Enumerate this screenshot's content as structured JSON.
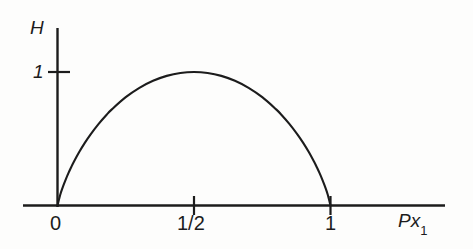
{
  "figure": {
    "kind": "line-plot",
    "background_color": "#fdfdfc",
    "ink_color": "#1c1c1c"
  },
  "axes": {
    "y_axis_label": "H",
    "x_axis_label_main": "Px",
    "x_axis_label_subscript": "1",
    "y_ticks": [
      {
        "value": 1,
        "label": "1"
      }
    ],
    "x_ticks": [
      {
        "value": 0,
        "label": "0"
      },
      {
        "value": 0.5,
        "label": "1/2"
      },
      {
        "value": 1,
        "label": "1"
      }
    ]
  },
  "chart_data": {
    "type": "line",
    "title": "",
    "subtitle": "",
    "xlabel": "Px1",
    "ylabel": "H",
    "xlim": [
      0,
      1.38
    ],
    "ylim": [
      0,
      1.3
    ],
    "grid": false,
    "legend": null,
    "xticks": [
      0,
      0.5,
      1
    ],
    "xticklabels": [
      "0",
      "1/2",
      "1"
    ],
    "yticks": [
      1
    ],
    "yticklabels": [
      "1"
    ],
    "annotations": [],
    "series": [
      {
        "name": "binary entropy H(p) = -p log2 p - (1-p) log2 (1-p)",
        "x": [
          0,
          0.01,
          0.02,
          0.03,
          0.04,
          0.05,
          0.06,
          0.08,
          0.1,
          0.12,
          0.15,
          0.18,
          0.2,
          0.25,
          0.3,
          0.35,
          0.4,
          0.45,
          0.5,
          0.55,
          0.6,
          0.65,
          0.7,
          0.75,
          0.8,
          0.82,
          0.85,
          0.88,
          0.9,
          0.92,
          0.94,
          0.95,
          0.96,
          0.97,
          0.98,
          0.99,
          1
        ],
        "y": [
          0,
          0.0808,
          0.1414,
          0.1944,
          0.2423,
          0.2864,
          0.3274,
          0.4022,
          0.469,
          0.5294,
          0.6098,
          0.6801,
          0.7219,
          0.8113,
          0.8813,
          0.9341,
          0.971,
          0.9928,
          1.0,
          0.9928,
          0.971,
          0.9341,
          0.8813,
          0.8113,
          0.7219,
          0.6801,
          0.6098,
          0.5294,
          0.469,
          0.4022,
          0.3274,
          0.2864,
          0.2423,
          0.1944,
          0.1414,
          0.0808,
          0
        ]
      }
    ]
  }
}
